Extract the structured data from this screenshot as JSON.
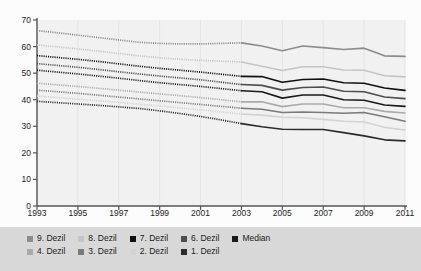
{
  "chart_data": {
    "type": "line",
    "title": "",
    "subtitle": "",
    "xlabel": "",
    "ylabel": "",
    "xlim": [
      1993,
      2011
    ],
    "ylim": [
      0,
      70
    ],
    "yticks": [
      0,
      10,
      20,
      30,
      40,
      50,
      60,
      70
    ],
    "xticks": [
      1993,
      1995,
      1997,
      1999,
      2001,
      2003,
      2005,
      2007,
      2009,
      2011
    ],
    "xtick_labels": [
      "1993",
      "1995",
      "1997",
      "1999",
      "2001",
      "2003",
      "2005",
      "2007",
      "2009",
      "2011"
    ],
    "ytick_labels": [
      "0",
      "10",
      "20",
      "30",
      "40",
      "50",
      "60",
      "70"
    ],
    "grid": "vertical-faint",
    "legend_position": "bottom",
    "dashed_until": 2003,
    "x": [
      1993,
      1994,
      1995,
      1996,
      1997,
      1998,
      1999,
      2000,
      2001,
      2002,
      2003,
      2004,
      2005,
      2006,
      2007,
      2008,
      2009,
      2010,
      2011
    ],
    "series": [
      {
        "name": "9. Dezil",
        "color": "#8c8c8c",
        "values": [
          66.0,
          65.2,
          64.3,
          63.4,
          62.5,
          61.6,
          61.2,
          61.0,
          61.0,
          61.2,
          61.4,
          60.2,
          58.4,
          60.2,
          59.6,
          58.9,
          59.4,
          56.5,
          56.3
        ]
      },
      {
        "name": "8. Dezil",
        "color": "#c4c4c4",
        "values": [
          60.6,
          59.9,
          59.1,
          58.3,
          57.4,
          56.5,
          55.8,
          55.2,
          54.8,
          54.5,
          54.2,
          52.6,
          51.0,
          52.4,
          52.4,
          51.2,
          51.1,
          49.0,
          48.6
        ]
      },
      {
        "name": "7. Dezil",
        "color": "#101010",
        "values": [
          56.6,
          55.9,
          55.2,
          54.4,
          53.5,
          52.6,
          51.8,
          51.1,
          50.4,
          49.6,
          48.8,
          48.7,
          46.6,
          47.6,
          47.8,
          46.4,
          46.2,
          44.4,
          43.5
        ]
      },
      {
        "name": "6. Dezil",
        "color": "#4d4d4d",
        "values": [
          53.6,
          52.9,
          52.2,
          51.4,
          50.5,
          49.7,
          48.9,
          48.2,
          47.5,
          46.6,
          45.7,
          45.4,
          43.6,
          44.6,
          44.8,
          43.2,
          43.0,
          41.0,
          40.4
        ]
      },
      {
        "name": "Median",
        "color": "#1a1a1a",
        "values": [
          51.1,
          50.4,
          49.7,
          48.9,
          48.1,
          47.2,
          46.4,
          45.7,
          45.0,
          44.2,
          43.4,
          43.0,
          40.6,
          41.8,
          41.8,
          40.0,
          39.8,
          38.0,
          37.5
        ]
      },
      {
        "name": "4. Dezil",
        "color": "#aaaaaa",
        "values": [
          46.2,
          45.6,
          45.0,
          44.3,
          43.6,
          42.9,
          42.2,
          41.5,
          40.8,
          40.0,
          39.2,
          39.2,
          37.4,
          38.4,
          38.4,
          37.0,
          37.0,
          35.6,
          35.0
        ]
      },
      {
        "name": "3. Dezil",
        "color": "#7a7a7a",
        "values": [
          43.6,
          43.0,
          42.4,
          41.7,
          41.0,
          40.3,
          39.6,
          38.9,
          38.2,
          37.5,
          36.8,
          36.4,
          35.2,
          35.4,
          35.2,
          34.9,
          35.2,
          33.6,
          31.9
        ]
      },
      {
        "name": "2. Dezil",
        "color": "#d2d2d2",
        "values": [
          41.4,
          40.8,
          40.2,
          39.6,
          39.0,
          38.3,
          37.6,
          36.9,
          36.2,
          35.4,
          34.6,
          34.2,
          33.4,
          33.2,
          32.6,
          31.9,
          31.6,
          29.6,
          28.6
        ]
      },
      {
        "name": "1. Dezil",
        "color": "#2b2b2b",
        "values": [
          39.4,
          38.9,
          38.4,
          37.9,
          37.3,
          36.7,
          35.8,
          34.8,
          33.7,
          32.4,
          31.0,
          29.8,
          28.9,
          28.8,
          28.8,
          27.6,
          26.4,
          24.9,
          24.5
        ]
      }
    ]
  },
  "legend": {
    "rows": [
      [
        {
          "label": "9. Dezil",
          "color": "#8c8c8c"
        },
        {
          "label": "8. Dezil",
          "color": "#c4c4c4"
        },
        {
          "label": "7. Dezil",
          "color": "#101010"
        },
        {
          "label": "6. Dezil",
          "color": "#4d4d4d"
        },
        {
          "label": "Median",
          "color": "#1a1a1a"
        }
      ],
      [
        {
          "label": "4. Dezil",
          "color": "#aaaaaa"
        },
        {
          "label": "3. Dezil",
          "color": "#7a7a7a"
        },
        {
          "label": "2. Dezil",
          "color": "#d2d2d2"
        },
        {
          "label": "1. Dezil",
          "color": "#2b2b2b"
        }
      ]
    ]
  },
  "colors": {
    "plot_background": "#f1f1f1",
    "legend_background": "#d8d8d8",
    "axis": "#555555",
    "gridline": "#e4e4e4",
    "page_background": "#fdfdfd"
  }
}
